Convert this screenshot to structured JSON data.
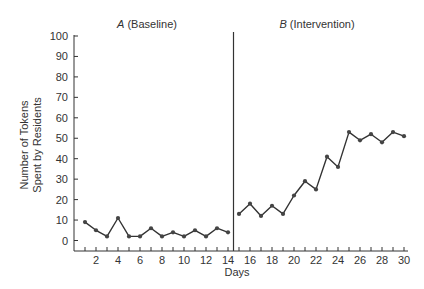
{
  "chart_data": {
    "type": "line",
    "title": "",
    "xlabel": "Days",
    "ylabel": "Number of Tokens Spent by Residents",
    "ylabel_lines": [
      "Number of Tokens",
      "Spent by Residents"
    ],
    "xlim": [
      0,
      30
    ],
    "ylim": [
      0,
      100
    ],
    "yticks": [
      0,
      10,
      20,
      30,
      40,
      50,
      60,
      70,
      80,
      90,
      100
    ],
    "xticks_labeled": [
      2,
      4,
      6,
      8,
      10,
      12,
      14,
      16,
      18,
      20,
      22,
      24,
      26,
      28,
      30
    ],
    "grid": false,
    "legend": null,
    "phase_change_at": 14.5,
    "phases": [
      {
        "italic": "A",
        "label": " (Baseline)",
        "days": [
          1,
          14
        ]
      },
      {
        "italic": "B",
        "label": " (Intervention)",
        "days": [
          15,
          30
        ]
      }
    ],
    "series": [
      {
        "name": "A (Baseline)",
        "x": [
          1,
          2,
          3,
          4,
          5,
          6,
          7,
          8,
          9,
          10,
          11,
          12,
          13,
          14
        ],
        "values": [
          9,
          5,
          2,
          11,
          2,
          2,
          6,
          2,
          4,
          2,
          5,
          2,
          6,
          4
        ]
      },
      {
        "name": "B (Intervention)",
        "x": [
          15,
          16,
          17,
          18,
          19,
          20,
          21,
          22,
          23,
          24,
          25,
          26,
          27,
          28,
          29,
          30
        ],
        "values": [
          13,
          18,
          12,
          17,
          13,
          22,
          29,
          25,
          41,
          36,
          53,
          49,
          52,
          48,
          53,
          51
        ]
      }
    ]
  },
  "colors": {
    "line": "#333333",
    "marker": "#444444",
    "axis": "#333333",
    "phase_line": "#333333"
  }
}
